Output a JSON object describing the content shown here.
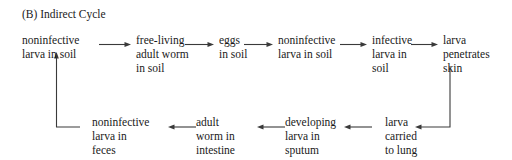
{
  "title": "(B) Indirect Cycle",
  "diagram": {
    "kind": "life-cycle-flow-diagram",
    "top_row": [
      {
        "id": "noninfective-larva-in-soil-top",
        "lines": [
          "noninfective",
          "larva in soil"
        ]
      },
      {
        "id": "free-living-adult-worm-in-soil",
        "lines": [
          "free-living",
          "adult worm",
          "in soil"
        ]
      },
      {
        "id": "eggs-in-soil",
        "lines": [
          "eggs",
          "in soil"
        ]
      },
      {
        "id": "noninfective-larva-in-soil-2",
        "lines": [
          "noninfective",
          "larva in soil"
        ]
      },
      {
        "id": "infective-larva-in-soil",
        "lines": [
          "infective",
          "larva in",
          "soil"
        ]
      },
      {
        "id": "larva-penetrates-skin",
        "lines": [
          "larva",
          "penetrates",
          "skin"
        ]
      }
    ],
    "bottom_row": [
      {
        "id": "noninfective-larva-in-feces",
        "lines": [
          "noninfective",
          "larva in",
          "feces"
        ]
      },
      {
        "id": "adult-worm-in-intestine",
        "lines": [
          "adult",
          "worm in",
          "intestine"
        ]
      },
      {
        "id": "developing-larva-in-sputum",
        "lines": [
          "developing",
          "larva in",
          "sputum"
        ]
      },
      {
        "id": "larva-carried-to-lung",
        "lines": [
          "larva",
          "carried",
          "to lung"
        ]
      }
    ],
    "arrows": {
      "top_row_direction": "right",
      "bottom_row_direction": "left",
      "left_connector": "feces-up-to-noninfective-larva-in-soil",
      "right_connector": "skin-down-to-larva-carried-to-lung"
    },
    "stroke_color": "#3a3a3a",
    "text_color": "#1a1a1a",
    "background_color": "#ffffff"
  }
}
